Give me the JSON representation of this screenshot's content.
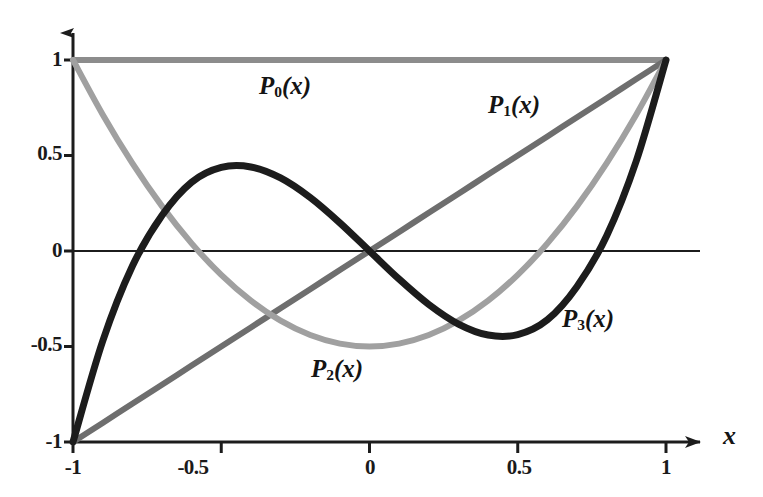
{
  "chart_data": {
    "type": "line",
    "title": "",
    "subtitle": "",
    "xlabel": "x",
    "ylabel": "",
    "xlim": [
      -1,
      1
    ],
    "ylim": [
      -1,
      1
    ],
    "grid": false,
    "legend_position": "inline-annotations",
    "x_ticks": [
      "-1",
      "-0.5",
      "0",
      "0.5",
      "1"
    ],
    "x_tick_values": [
      -1,
      -0.5,
      0,
      0.5,
      1
    ],
    "y_ticks": [
      "-1",
      "-0.5",
      "0",
      "0.5",
      "1"
    ],
    "y_tick_values": [
      -1,
      -0.5,
      0,
      0.5,
      1
    ],
    "series": [
      {
        "name": "P0(x)",
        "label_base": "P",
        "label_sub": "0",
        "label_arg": "(x)",
        "formula": "1",
        "color": "#8c8c8c",
        "width": 6,
        "x": [
          -1,
          -0.9,
          -0.8,
          -0.7,
          -0.6,
          -0.5,
          -0.4,
          -0.3,
          -0.2,
          -0.1,
          0,
          0.1,
          0.2,
          0.3,
          0.4,
          0.5,
          0.6,
          0.7,
          0.8,
          0.9,
          1
        ],
        "values": [
          1,
          1,
          1,
          1,
          1,
          1,
          1,
          1,
          1,
          1,
          1,
          1,
          1,
          1,
          1,
          1,
          1,
          1,
          1,
          1,
          1
        ],
        "annotation_x": -0.33,
        "annotation_y": 0.78
      },
      {
        "name": "P1(x)",
        "label_base": "P",
        "label_sub": "1",
        "label_arg": "(x)",
        "formula": "x",
        "color": "#6e6e6e",
        "width": 6,
        "x": [
          -1,
          -0.9,
          -0.8,
          -0.7,
          -0.6,
          -0.5,
          -0.4,
          -0.3,
          -0.2,
          -0.1,
          0,
          0.1,
          0.2,
          0.3,
          0.4,
          0.5,
          0.6,
          0.7,
          0.8,
          0.9,
          1
        ],
        "values": [
          -1,
          -0.9,
          -0.8,
          -0.7,
          -0.6,
          -0.5,
          -0.4,
          -0.3,
          -0.2,
          -0.1,
          0,
          0.1,
          0.2,
          0.3,
          0.4,
          0.5,
          0.6,
          0.7,
          0.8,
          0.9,
          1
        ],
        "annotation_x": 0.43,
        "annotation_y": 0.57
      },
      {
        "name": "P2(x)",
        "label_base": "P",
        "label_sub": "2",
        "label_arg": "(x)",
        "formula": "(3x^2 - 1)/2",
        "color": "#a0a0a0",
        "width": 6,
        "x": [
          -1,
          -0.9,
          -0.8,
          -0.7,
          -0.6,
          -0.5,
          -0.4,
          -0.3,
          -0.2,
          -0.1,
          0,
          0.1,
          0.2,
          0.3,
          0.4,
          0.5,
          0.6,
          0.7,
          0.8,
          0.9,
          1
        ],
        "values": [
          1,
          0.715,
          0.46,
          0.235,
          0.04,
          -0.125,
          -0.26,
          -0.365,
          -0.44,
          -0.485,
          -0.5,
          -0.485,
          -0.44,
          -0.365,
          -0.26,
          -0.125,
          0.04,
          0.235,
          0.46,
          0.715,
          1
        ],
        "annotation_x": -0.11,
        "annotation_y": -0.7
      },
      {
        "name": "P3(x)",
        "label_base": "P",
        "label_sub": "3",
        "label_arg": "(x)",
        "formula": "(5x^3 - 3x)/2",
        "color": "#1c1c1c",
        "width": 7,
        "x": [
          -1,
          -0.9,
          -0.8,
          -0.7,
          -0.6,
          -0.5,
          -0.4,
          -0.3,
          -0.2,
          -0.1,
          0,
          0.1,
          0.2,
          0.3,
          0.4,
          0.5,
          0.6,
          0.7,
          0.8,
          0.9,
          1
        ],
        "values": [
          -1,
          -0.4725,
          -0.08,
          0.1855,
          0.36,
          0.4375,
          0.44,
          0.3825,
          0.28,
          0.1475,
          0,
          -0.1475,
          -0.28,
          -0.3825,
          -0.44,
          -0.4375,
          -0.36,
          -0.1855,
          0.08,
          0.4725,
          1
        ],
        "annotation_x": 0.68,
        "annotation_y": -0.35
      }
    ],
    "axis_color": "#1c1c1c",
    "zero_line_y": 0
  },
  "axes": {
    "x_axis_name": "x",
    "y_axis_name": ""
  }
}
